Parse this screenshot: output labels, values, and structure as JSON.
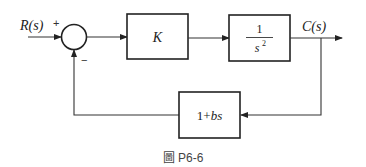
{
  "diagram": {
    "type": "feedback-control-block-diagram",
    "input_label": "R(s)",
    "output_label": "C(s)",
    "summing_junction": {
      "plus_sign": "+",
      "minus_sign": "−"
    },
    "forward_blocks": [
      {
        "id": "controller",
        "label": "K"
      },
      {
        "id": "plant",
        "numerator": "1",
        "denominator_base": "s",
        "denominator_exp": "2"
      }
    ],
    "feedback_block": {
      "label_const": "1",
      "label_plus": "+",
      "label_var": "bs"
    },
    "caption": {
      "prefix": "圖",
      "number": "P6-6"
    },
    "colors": {
      "line": "#333333",
      "box_stroke": "#222222",
      "text": "#222222",
      "background": "#ffffff"
    }
  }
}
